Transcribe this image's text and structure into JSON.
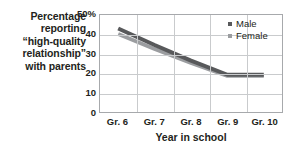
{
  "chart_data": {
    "type": "line",
    "title": "",
    "ylabel": "Percentage reporting “high-quality relationship” with parents",
    "ylabel_lines": [
      "Percentage",
      "reporting",
      "“high-quality",
      "relationship”",
      "with parents"
    ],
    "xlabel": "Year in school",
    "categories": [
      "Gr. 6",
      "Gr. 7",
      "Gr. 8",
      "Gr. 9",
      "Gr. 10"
    ],
    "ylim": [
      0,
      50
    ],
    "yticks": [
      "0",
      "10",
      "20",
      "30",
      "40",
      "50%"
    ],
    "ytick_values": [
      0,
      10,
      20,
      30,
      40,
      50
    ],
    "grid": "horizontal-and-vertical",
    "legend_position": "top-right",
    "series": [
      {
        "name": "Male",
        "color": "#58595b",
        "values": [
          43.0,
          34.5,
          26.5,
          19.2,
          19.2
        ]
      },
      {
        "name": "Female",
        "color": "#9b9da0",
        "values": [
          40.2,
          32.5,
          25.3,
          18.6,
          18.6
        ]
      }
    ]
  },
  "colors": {
    "axis": "#a7a9ac",
    "grid": "#c9cbcd",
    "text": "#231f20",
    "male": "#58595b",
    "female": "#9b9da0",
    "background": "#ffffff"
  }
}
